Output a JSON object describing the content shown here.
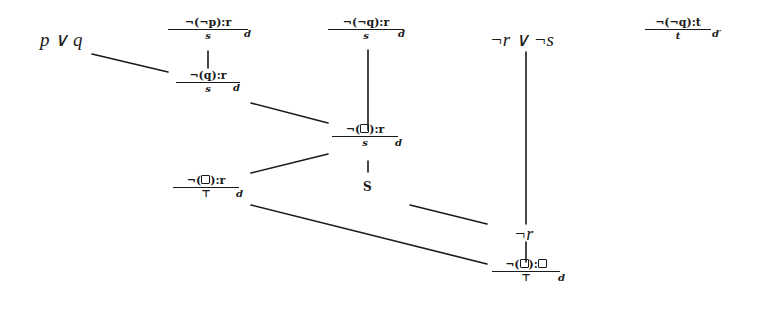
{
  "diagram": {
    "title": "",
    "nodes": {
      "p_or_q": {
        "text": "p ∨ q"
      },
      "not_r_or_not_s": {
        "text": "¬r ∨ ¬s"
      },
      "s_plain": {
        "text": "S"
      },
      "not_r": {
        "text": "¬r"
      },
      "default_nnp": {
        "prereq": "¬(¬p):r",
        "conclusion": "s",
        "label": "d"
      },
      "default_nq": {
        "prereq": "¬(q):r",
        "conclusion": "s",
        "label": "d"
      },
      "default_nnq": {
        "prereq": "¬(¬q):r",
        "conclusion": "s",
        "label": "d"
      },
      "default_nnq_t": {
        "prereq": "¬(¬q):t",
        "conclusion": "t",
        "label": "d′"
      },
      "default_nbox_s": {
        "prereq_pre": "¬(",
        "prereq_post": "):r",
        "conclusion": "s",
        "label": "d"
      },
      "default_nbox_top": {
        "prereq_pre": "¬(",
        "prereq_post": "):r",
        "conclusion": "⊤",
        "label": "d"
      },
      "default_nbox_box": {
        "prereq_pre": "¬(",
        "prereq_mid": "):",
        "conclusion": "⊤",
        "label": "d"
      }
    },
    "edges": [
      {
        "from": "p_or_q",
        "to": "default_nq"
      },
      {
        "from": "default_nnp",
        "to": "default_nq"
      },
      {
        "from": "default_nq",
        "to": "default_nbox_s"
      },
      {
        "from": "default_nnq",
        "to": "default_nbox_s"
      },
      {
        "from": "default_nbox_s",
        "to": "s_plain"
      },
      {
        "from": "default_nbox_top",
        "to": "default_nbox_s"
      },
      {
        "from": "default_nbox_top",
        "to": "default_nbox_box"
      },
      {
        "from": "s_plain",
        "to": "not_r"
      },
      {
        "from": "not_r_or_not_s",
        "to": "not_r"
      },
      {
        "from": "not_r",
        "to": "default_nbox_box"
      }
    ]
  }
}
